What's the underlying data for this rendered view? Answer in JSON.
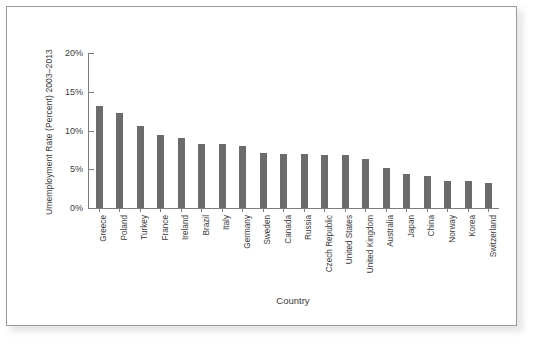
{
  "figure": {
    "frame_border_color": "#9a9a9a",
    "background_color": "#ffffff"
  },
  "chart_data": {
    "type": "bar",
    "title": "",
    "xlabel": "Country",
    "ylabel": "Umemployment Rate (Percent) 2003–2013",
    "ylim": [
      0,
      20
    ],
    "grid": false,
    "legend": null,
    "bar_color": "#6b6b6b",
    "axis_color": "#7d7d7d",
    "ytick_labels": [
      "20%",
      "15%",
      "10%",
      "5%",
      "0%"
    ],
    "ytick_values": [
      20,
      15,
      10,
      5,
      0
    ],
    "categories": [
      "Greece",
      "Poland",
      "Turkey",
      "France",
      "Ireland",
      "Brazil",
      "Italy",
      "Germany",
      "Sweden",
      "Canada",
      "Russia",
      "Czech Republic",
      "United States",
      "United Kingdom",
      "Australia",
      "Japan",
      "China",
      "Norway",
      "Korea",
      "Switzerland"
    ],
    "values": [
      13.1,
      12.2,
      10.6,
      9.4,
      9.0,
      8.3,
      8.2,
      8.0,
      7.1,
      7.0,
      7.0,
      6.9,
      6.8,
      6.3,
      5.1,
      4.4,
      4.1,
      3.5,
      3.5,
      3.2
    ]
  }
}
